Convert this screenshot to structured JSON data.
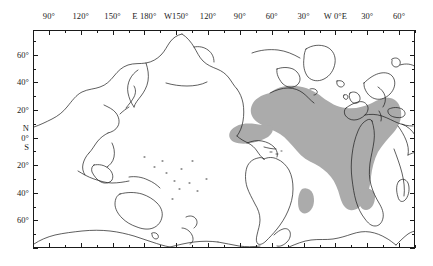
{
  "figure": {
    "kind": "world-map",
    "projection": "equirectangular, Pacific-centred",
    "frame": {
      "x": 33,
      "y": 30,
      "width": 382,
      "height": 218
    }
  },
  "axes": {
    "longitude": {
      "label_positions_deg": [
        90,
        120,
        150,
        180,
        -150,
        -120,
        -90,
        -60,
        -30,
        0,
        30,
        60
      ],
      "labels": [
        "90°",
        "120°",
        "150°",
        "E 180°",
        "W150°",
        "120°",
        "90°",
        "60°",
        "30°",
        "W 0°E",
        "30°",
        "60°"
      ],
      "range_deg": [
        75,
        435
      ],
      "major_step_deg": 30,
      "minor_step_deg": 15
    },
    "latitude": {
      "labels": [
        "60°",
        "40°",
        "20°",
        "N",
        "0°",
        "S",
        "20°",
        "40°",
        "60°"
      ],
      "label_values_deg": [
        60,
        40,
        20,
        7,
        0,
        -7,
        -20,
        -40,
        -60
      ],
      "range_deg": [
        -80,
        78
      ],
      "major_step_deg": 20,
      "minor_step_deg": 10
    }
  },
  "legend": {
    "shaded_region_meaning": "shaded distribution range",
    "shade_color": "#ababab",
    "coastline_color": "#1a1a1a",
    "frame_color": "#1a1a1a",
    "background_color": "#ffffff"
  },
  "regions": {
    "shaded_polygons_description": [
      "main Atlantic Ocean body from eastern North America across to western Europe and Africa, tapering south past the Cape of Good Hope",
      "Gulf of Mexico and Caribbean lobe",
      "small isolated patch in the South Atlantic off Brazil",
      "small isolated patch in the south-west Indian Ocean off Madagascar"
    ]
  }
}
